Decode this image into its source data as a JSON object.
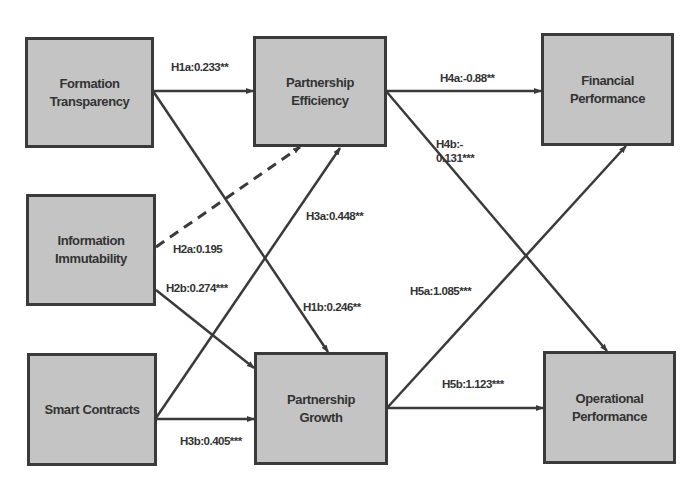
{
  "diagram": {
    "type": "structural-path-model",
    "nodes": [
      {
        "id": "formation_transparency",
        "line1": "Formation",
        "line2": "Transparency"
      },
      {
        "id": "information_immutability",
        "line1": "Information",
        "line2": "Immutability"
      },
      {
        "id": "smart_contracts",
        "line1": "Smart Contracts",
        "line2": ""
      },
      {
        "id": "partnership_efficiency",
        "line1": "Partnership",
        "line2": "Efficiency"
      },
      {
        "id": "partnership_growth",
        "line1": "Partnership",
        "line2": "Growth"
      },
      {
        "id": "financial_performance",
        "line1": "Financial",
        "line2": "Performance"
      },
      {
        "id": "operational_performance",
        "line1": "Operational",
        "line2": "Performance"
      }
    ],
    "edges": [
      {
        "id": "H1a",
        "from": "formation_transparency",
        "to": "partnership_efficiency",
        "label": "H1a:0.233**",
        "style": "solid"
      },
      {
        "id": "H1b",
        "from": "formation_transparency",
        "to": "partnership_growth",
        "label": "H1b:0.246**",
        "style": "solid"
      },
      {
        "id": "H2a",
        "from": "information_immutability",
        "to": "partnership_efficiency",
        "label": "H2a:0.195",
        "style": "dashed"
      },
      {
        "id": "H2b",
        "from": "information_immutability",
        "to": "partnership_growth",
        "label": "H2b:0.274***",
        "style": "solid"
      },
      {
        "id": "H3a",
        "from": "smart_contracts",
        "to": "partnership_efficiency",
        "label": "H3a:0.448**",
        "style": "solid"
      },
      {
        "id": "H3b",
        "from": "smart_contracts",
        "to": "partnership_growth",
        "label": "H3b:0.405***",
        "style": "solid"
      },
      {
        "id": "H4a",
        "from": "partnership_efficiency",
        "to": "financial_performance",
        "label": "H4a:-0.88**",
        "style": "solid"
      },
      {
        "id": "H4b",
        "from": "partnership_efficiency",
        "to": "operational_performance",
        "label_line1": "H4b:-",
        "label_line2": "0.131***",
        "style": "solid"
      },
      {
        "id": "H5a",
        "from": "partnership_growth",
        "to": "financial_performance",
        "label": "H5a:1.085***",
        "style": "solid"
      },
      {
        "id": "H5b",
        "from": "partnership_growth",
        "to": "operational_performance",
        "label": "H5b:1.123***",
        "style": "solid"
      }
    ]
  },
  "colors": {
    "node_fill": "#c4c4c4",
    "node_border": "#3a3a3a",
    "edge": "#3a3a3a",
    "text": "#333333"
  }
}
